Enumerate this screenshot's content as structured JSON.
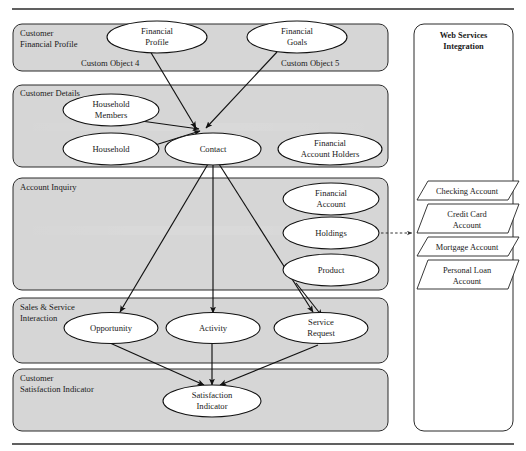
{
  "diagram": {
    "type": "swimlane-object-model",
    "top_rule": true,
    "bottom_rule": true,
    "lanes": [
      {
        "id": "customer-financial-profile",
        "title": "Customer\nFinancial Profile",
        "title_lines": [
          "Customer",
          "Financial Profile"
        ],
        "annotations": [
          {
            "id": "custom-object-4",
            "text": "Custom Object 4"
          },
          {
            "id": "custom-object-5",
            "text": "Custom Object 5"
          }
        ],
        "nodes": [
          {
            "id": "financial-profile",
            "lines": [
              "Financial",
              "Profile"
            ]
          },
          {
            "id": "financial-goals",
            "lines": [
              "Financial",
              "Goals"
            ]
          }
        ]
      },
      {
        "id": "customer-details",
        "title": "Customer Details",
        "title_lines": [
          "Customer Details"
        ],
        "annotations": [],
        "nodes": [
          {
            "id": "household-members",
            "lines": [
              "Household",
              "Members"
            ]
          },
          {
            "id": "household",
            "lines": [
              "Household"
            ]
          },
          {
            "id": "contact",
            "lines": [
              "Contact"
            ]
          },
          {
            "id": "financial-account-holders",
            "lines": [
              "Financial",
              "Account Holders"
            ]
          }
        ]
      },
      {
        "id": "account-inquiry",
        "title": "Account Inquiry",
        "title_lines": [
          "Account Inquiry"
        ],
        "annotations": [],
        "nodes": [
          {
            "id": "financial-account",
            "lines": [
              "Financial",
              "Account"
            ]
          },
          {
            "id": "holdings",
            "lines": [
              "Holdings"
            ]
          },
          {
            "id": "product",
            "lines": [
              "Product"
            ]
          }
        ]
      },
      {
        "id": "sales-service-interaction",
        "title": "Sales & Service\nInteraction",
        "title_lines": [
          "Sales & Service",
          "Interaction"
        ],
        "annotations": [],
        "nodes": [
          {
            "id": "opportunity",
            "lines": [
              "Opportunity"
            ]
          },
          {
            "id": "activity",
            "lines": [
              "Activity"
            ]
          },
          {
            "id": "service-request",
            "lines": [
              "Service",
              "Request"
            ]
          }
        ]
      },
      {
        "id": "customer-satisfaction-indicator",
        "title": "Customer\nSatisfaction Indicator",
        "title_lines": [
          "Customer",
          "Satisfaction Indicator"
        ],
        "annotations": [],
        "nodes": [
          {
            "id": "satisfaction-indicator",
            "lines": [
              "Satisfaction",
              "Indicator"
            ]
          }
        ]
      }
    ],
    "side_panel": {
      "id": "web-services-integration",
      "title_lines": [
        "Web Services",
        "Integration"
      ],
      "items": [
        {
          "id": "checking-account",
          "lines": [
            "Checking Account"
          ]
        },
        {
          "id": "credit-card-account",
          "lines": [
            "Credit Card",
            "Account"
          ]
        },
        {
          "id": "mortgage-account",
          "lines": [
            "Mortgage Account"
          ]
        },
        {
          "id": "personal-loan-account",
          "lines": [
            "Personal Loan",
            "Account"
          ]
        }
      ]
    },
    "edges": [
      {
        "from": "financial-profile",
        "to": "contact",
        "style": "solid"
      },
      {
        "from": "financial-goals",
        "to": "contact",
        "style": "solid"
      },
      {
        "from": "household-members",
        "to": "contact",
        "style": "solid"
      },
      {
        "from": "household",
        "to": "contact",
        "style": "solid"
      },
      {
        "from": "contact",
        "to": "opportunity",
        "style": "solid"
      },
      {
        "from": "contact",
        "to": "activity",
        "style": "solid"
      },
      {
        "from": "contact",
        "to": "service-request",
        "style": "solid"
      },
      {
        "from": "product",
        "to": "service-request",
        "style": "solid"
      },
      {
        "from": "opportunity",
        "to": "satisfaction-indicator",
        "style": "solid"
      },
      {
        "from": "activity",
        "to": "satisfaction-indicator",
        "style": "solid"
      },
      {
        "from": "service-request",
        "to": "satisfaction-indicator",
        "style": "solid"
      },
      {
        "from": "holdings",
        "to": "web-services-integration",
        "style": "dashed"
      }
    ],
    "colors": {
      "lane_fill": "#d6d6d6",
      "node_fill": "#ffffff",
      "stroke": "#111111",
      "panel_fill": "#ffffff",
      "text": "#1a1a1a"
    }
  }
}
